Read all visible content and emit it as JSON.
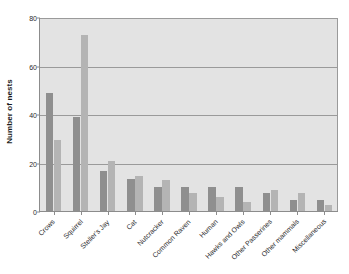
{
  "chart_data": {
    "type": "bar",
    "title": "",
    "xlabel": "",
    "ylabel": "Number of nests",
    "ylim": [
      0,
      80
    ],
    "yticks": [
      0,
      20,
      40,
      60,
      80
    ],
    "grid": true,
    "legend": "none",
    "categories": [
      "Crows",
      "Squirrel",
      "Steller's Jay",
      "Cat",
      "Nutcracker",
      "Common Raven",
      "Human",
      "Hawks and Owls",
      "Other Passerines",
      "Other mammals",
      "Miscellaneous"
    ],
    "series": [
      {
        "name": "series-1",
        "color": "#8f8f8f",
        "values": [
          49,
          39,
          17,
          13.5,
          10.5,
          10.5,
          10.5,
          10.5,
          8,
          5,
          5
        ]
      },
      {
        "name": "series-2",
        "color": "#b4b4b4",
        "values": [
          29.5,
          73,
          21,
          15,
          13,
          8,
          6,
          4,
          9,
          8,
          3
        ]
      }
    ],
    "plot_background": "#e3e3e3",
    "axis_color": "#8c8c8c",
    "gridline_color": "#9a9a9a",
    "text_color": "#2b2b2b"
  }
}
